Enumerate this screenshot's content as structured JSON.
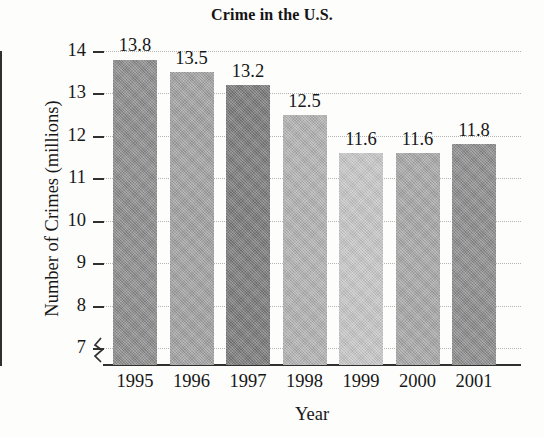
{
  "chart_data": {
    "type": "bar",
    "title": "Crime in the U.S.",
    "xlabel": "Year",
    "ylabel": "Number of Crimes (millions)",
    "categories": [
      "1995",
      "1996",
      "1997",
      "1998",
      "1999",
      "2000",
      "2001"
    ],
    "values": [
      13.8,
      13.5,
      13.2,
      12.5,
      11.6,
      11.6,
      11.8
    ],
    "value_labels": [
      "13.8",
      "13.5",
      "13.2",
      "12.5",
      "11.6",
      "11.6",
      "11.8"
    ],
    "ytick_labels": [
      "14",
      "13",
      "12",
      "11",
      "10",
      "9",
      "8",
      "7"
    ],
    "ytick_values": [
      14,
      13,
      12,
      11,
      10,
      9,
      8,
      7
    ],
    "ylim": [
      6.6,
      14.0
    ],
    "axis_break": true,
    "axis_break_label": "y-axis-break-zigzag",
    "grid": true,
    "grid_style": "dotted-horizontal",
    "legend": "none",
    "bar_colors": [
      "#8b8b8b",
      "#a0a0a0",
      "#797979",
      "#b1b1b1",
      "#c6c6c6",
      "#a6a6a6",
      "#8b8b8b"
    ],
    "axis_color": "#303030",
    "grid_color": "#b5b5b5",
    "background_color": "#fdfdfc",
    "text_color": "#171717"
  }
}
